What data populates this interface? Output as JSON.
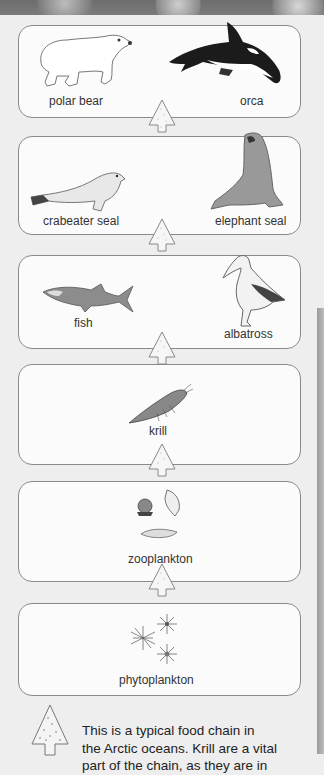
{
  "food_chain": {
    "levels": [
      {
        "items": [
          {
            "label": "polar bear",
            "icon": "polar-bear-icon"
          },
          {
            "label": "orca",
            "icon": "orca-icon"
          }
        ]
      },
      {
        "items": [
          {
            "label": "crabeater seal",
            "icon": "crabeater-seal-icon"
          },
          {
            "label": "elephant seal",
            "icon": "elephant-seal-icon"
          }
        ]
      },
      {
        "items": [
          {
            "label": "fish",
            "icon": "fish-icon"
          },
          {
            "label": "albatross",
            "icon": "albatross-icon"
          }
        ]
      },
      {
        "items": [
          {
            "label": "krill",
            "icon": "krill-icon"
          }
        ]
      },
      {
        "items": [
          {
            "label": "zooplankton",
            "icon": "zooplankton-icon"
          }
        ]
      },
      {
        "items": [
          {
            "label": "phytoplankton",
            "icon": "phytoplankton-icon"
          }
        ]
      }
    ],
    "arrow_icon": "up-arrow-icon"
  },
  "caption": {
    "lines": [
      "This is a typical food chain in",
      "the Arctic oceans. Krill are a vital",
      "part of the chain, as they are in"
    ]
  },
  "colors": {
    "background": "#eeeeee",
    "box_border": "#8a8a8a",
    "box_fill": "#fbfbfb",
    "side_panel": "#a8a8a8"
  }
}
